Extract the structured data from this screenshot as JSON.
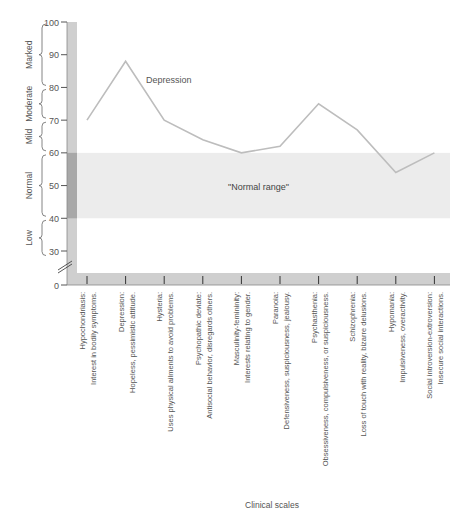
{
  "chart_data": {
    "type": "line",
    "title": "",
    "xlabel": "Clinical scales",
    "ylabel": "",
    "ylim": [
      0,
      100
    ],
    "axis_break": true,
    "yticks": [
      0,
      30,
      40,
      50,
      60,
      70,
      80,
      90,
      100
    ],
    "categories": [
      {
        "name": "Hypochondriasis:",
        "desc": "Interest in bodily symptoms."
      },
      {
        "name": "Depression:",
        "desc": "Hopeless, pessimistic attitude."
      },
      {
        "name": "Hysteria:",
        "desc": "Uses physical ailments to avoid problems."
      },
      {
        "name": "Psychopathic deviate:",
        "desc": "Antisocial behavior, disregards others."
      },
      {
        "name": "Masculinity-femininity:",
        "desc": "Interests relating to gender."
      },
      {
        "name": "Paranoia:",
        "desc": "Defensiveness, suspiciousness, jealousy."
      },
      {
        "name": "Psychasthenia:",
        "desc": "Obsessiveness, compulsiveness, or suspiciousness."
      },
      {
        "name": "Schizophrenia:",
        "desc": "Loss of touch with reality, bizarre delusions."
      },
      {
        "name": "Hypomania:",
        "desc": "Impulsiveness, overactivity."
      },
      {
        "name": "Social introversion-extroversion:",
        "desc": "Insecure social interactions."
      }
    ],
    "series": [
      {
        "name": "Depression",
        "values": [
          70,
          88,
          70,
          64,
          60,
          62,
          75,
          67,
          54,
          60
        ]
      }
    ],
    "annotations": [
      {
        "text": "Depression",
        "near_category": 1
      },
      {
        "text": "\"Normal range\"",
        "range": [
          40,
          60
        ]
      }
    ],
    "bands": [
      {
        "label": "Marked",
        "range": [
          80,
          100
        ]
      },
      {
        "label": "Moderate",
        "range": [
          70,
          80
        ]
      },
      {
        "label": "Mild",
        "range": [
          60,
          70
        ]
      },
      {
        "label": "Normal",
        "range": [
          40,
          60
        ]
      },
      {
        "label": "Low",
        "range": [
          28,
          40
        ]
      }
    ],
    "normal_range": [
      40,
      60
    ],
    "grid": false,
    "legend": "none"
  },
  "colors": {
    "line": "#bdbdbd",
    "axis_bar": "#cfcfcf",
    "axis_bar_dark": "#a8a8a8",
    "normal_band": "#ececec",
    "text": "#555555"
  }
}
